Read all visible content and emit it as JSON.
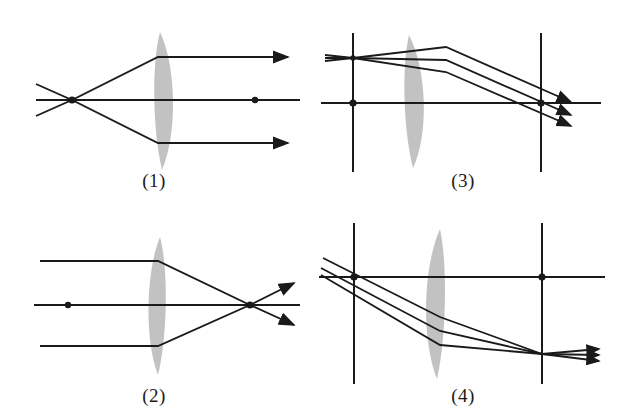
{
  "figure": {
    "background_color": "#ffffff",
    "ink_color": "#1a1a1a",
    "lens_fill_color": "#c2c2c2",
    "panel_count": 4
  },
  "panels": [
    {
      "id": "panel-1",
      "label": "(1)",
      "position": "top-left",
      "description": "Rays diverging from an on-axis focal point are refracted by the plano-convex lens into a parallel beam travelling to the right.",
      "lens": {
        "type": "plano-convex",
        "flat_side": "left",
        "curved_side": "right",
        "center_x": 168,
        "top_y": 32,
        "bottom_y": 170,
        "thickness": 30
      },
      "optical_axis": {
        "y": 100,
        "x_start": 36,
        "x_end": 300
      },
      "points": [
        {
          "name": "focal-point-left",
          "x": 72,
          "y": 100
        },
        {
          "name": "axis-marker-right",
          "x": 255,
          "y": 100
        }
      ],
      "vertical_lines": [],
      "rays": [
        {
          "name": "upper-ray",
          "points": [
            [
              36,
              84
            ],
            [
              72,
              100
            ],
            [
              158,
              57
            ],
            [
              288,
              57
            ]
          ],
          "arrow": true
        },
        {
          "name": "axis-ray",
          "points": [
            [
              36,
              100
            ],
            [
              300,
              100
            ]
          ],
          "arrow": false
        },
        {
          "name": "lower-ray",
          "points": [
            [
              36,
              116
            ],
            [
              72,
              100
            ],
            [
              158,
              143
            ],
            [
              288,
              143
            ]
          ],
          "arrow": true
        }
      ]
    },
    {
      "id": "panel-2",
      "label": "(2)",
      "position": "bottom-left",
      "description": "A parallel beam entering from the left is refracted by the plano-convex lens and converges to an on-axis focal point to the right, rays continuing past it.",
      "lens": {
        "type": "plano-convex",
        "flat_side": "right",
        "curved_side": "left",
        "center_x": 155,
        "top_y": 28,
        "bottom_y": 166,
        "thickness": 30
      },
      "optical_axis": {
        "y": 96,
        "x_start": 34,
        "x_end": 300
      },
      "points": [
        {
          "name": "axis-marker-left",
          "x": 68,
          "y": 96
        },
        {
          "name": "focal-point-right",
          "x": 250,
          "y": 96
        }
      ],
      "vertical_lines": [],
      "rays": [
        {
          "name": "upper-ray",
          "points": [
            [
              40,
              52
            ],
            [
              158,
              52
            ],
            [
              250,
              96
            ],
            [
              294,
              74
            ]
          ],
          "arrow": true
        },
        {
          "name": "axis-ray",
          "points": [
            [
              34,
              96
            ],
            [
              300,
              96
            ]
          ],
          "arrow": false
        },
        {
          "name": "lower-ray",
          "points": [
            [
              40,
              137
            ],
            [
              158,
              137
            ],
            [
              250,
              96
            ],
            [
              294,
              116
            ]
          ],
          "arrow": true
        }
      ]
    },
    {
      "id": "panel-3",
      "label": "(3)",
      "position": "top-right",
      "description": "Rays from an off-axis object point on the left focal plane pass through the lens and converge toward the right focal plane, forming an inverted image below the axis.",
      "lens": {
        "type": "plano-convex",
        "flat_side": "left",
        "curved_side": "right",
        "center_x": 107,
        "top_y": 35,
        "bottom_y": 168,
        "thickness": 28
      },
      "optical_axis": {
        "y": 103,
        "x_start": 12,
        "x_end": 292
      },
      "points": [
        {
          "name": "left-focal-point",
          "x": 44,
          "y": 103
        },
        {
          "name": "right-focal-point",
          "x": 232,
          "y": 103
        },
        {
          "name": "object-point",
          "x": 44,
          "y": 58
        }
      ],
      "vertical_lines": [
        {
          "name": "left-focal-plane",
          "x": 44,
          "y_top": 33,
          "y_bottom": 172
        },
        {
          "name": "right-focal-plane",
          "x": 232,
          "y_top": 33,
          "y_bottom": 172
        }
      ],
      "rays": [
        {
          "name": "upper-ray",
          "points": [
            [
              16,
              55
            ],
            [
              44,
              58
            ],
            [
              137,
              47
            ],
            [
              262,
              102
            ]
          ],
          "arrow": true
        },
        {
          "name": "middle-ray",
          "points": [
            [
              16,
              58
            ],
            [
              44,
              58
            ],
            [
              137,
              60
            ],
            [
              262,
              115
            ]
          ],
          "arrow": true
        },
        {
          "name": "lower-ray",
          "points": [
            [
              16,
              61
            ],
            [
              44,
              58
            ],
            [
              137,
              72
            ],
            [
              262,
              126
            ]
          ],
          "arrow": true
        }
      ]
    },
    {
      "id": "panel-4",
      "label": "(4)",
      "position": "bottom-right",
      "description": "Rays from an off-axis point to the upper left cross the optical axis at the left focal plane, pass through the lens and converge to a point below the axis at the right focal plane.",
      "lens": {
        "type": "plano-convex",
        "flat_side": "right",
        "curved_side": "left",
        "center_x": 120,
        "top_y": 20,
        "bottom_y": 170,
        "thickness": 26
      },
      "optical_axis": {
        "y": 68,
        "x_start": 10,
        "x_end": 296
      },
      "points": [
        {
          "name": "left-focal-point",
          "x": 45,
          "y": 68
        },
        {
          "name": "right-focal-point",
          "x": 233,
          "y": 68
        }
      ],
      "vertical_lines": [
        {
          "name": "left-focal-plane",
          "x": 45,
          "y_top": 14,
          "y_bottom": 175
        },
        {
          "name": "right-focal-plane",
          "x": 233,
          "y_top": 14,
          "y_bottom": 175
        }
      ],
      "rays": [
        {
          "name": "upper-ray",
          "points": [
            [
              14,
              49
            ],
            [
              131,
              108
            ],
            [
              233,
              145
            ],
            [
              290,
              140
            ]
          ],
          "arrow": true
        },
        {
          "name": "middle-ray",
          "points": [
            [
              12,
              59
            ],
            [
              131,
              122
            ],
            [
              233,
              145
            ],
            [
              290,
              146
            ]
          ],
          "arrow": true
        },
        {
          "name": "lower-ray",
          "points": [
            [
              12,
              66
            ],
            [
              131,
              136
            ],
            [
              233,
              145
            ],
            [
              290,
              152
            ]
          ],
          "arrow": true
        }
      ]
    }
  ]
}
